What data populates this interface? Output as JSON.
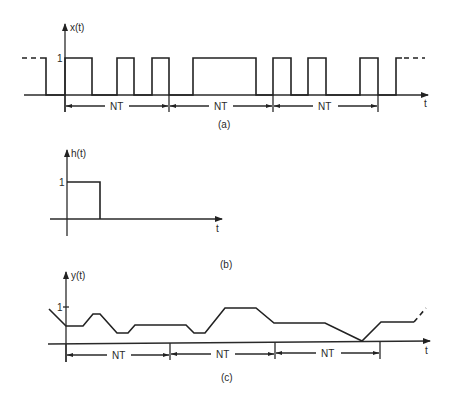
{
  "figure": {
    "panel_a": {
      "ylabel": "x(t)",
      "xlabel": "t",
      "level_label": "1",
      "interval_labels": [
        "NT",
        "NT",
        "NT"
      ],
      "caption": "(a)",
      "pulses": [
        [
          65,
          92
        ],
        [
          117,
          134
        ],
        [
          152,
          169
        ],
        [
          193,
          256
        ],
        [
          273,
          291
        ],
        [
          308,
          326
        ],
        [
          360,
          378
        ]
      ]
    },
    "panel_b": {
      "ylabel": "h(t)",
      "xlabel": "t",
      "level_label": "1",
      "caption": "(b)"
    },
    "panel_c": {
      "ylabel": "y(t)",
      "xlabel": "t",
      "level_label": "1",
      "interval_labels": [
        "NT",
        "NT",
        "NT"
      ],
      "caption": "(c)"
    }
  },
  "colors": {
    "ink": "#222222",
    "background": "#ffffff"
  }
}
